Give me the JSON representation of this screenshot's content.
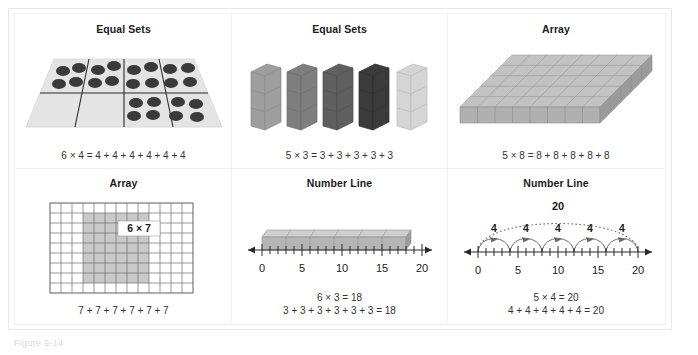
{
  "figure": {
    "caption": "Figure 9-14",
    "panels": [
      {
        "id": "equal-sets-dots",
        "title": "Equal Sets",
        "model": "equal-sets",
        "equation_line1": "6 × 4 = 4 + 4 + 4 + 4 + 4 + 4",
        "equation_line2": "",
        "groups": 6,
        "items_per_group": 4,
        "product": 24,
        "item_shape": "dot",
        "dot_color": "#3a3a3a",
        "mat_color": "#e2e2e2"
      },
      {
        "id": "equal-sets-cubes",
        "title": "Equal Sets",
        "model": "equal-sets",
        "equation_line1": "5 × 3 = 3 + 3 + 3 + 3 + 3",
        "equation_line2": "",
        "groups": 5,
        "items_per_group": 3,
        "product": 15,
        "item_shape": "cube",
        "tower_colors": [
          "#9e9e9e",
          "#7e7e7e",
          "#5f5f5f",
          "#3b3b3b",
          "#d5d5d5"
        ]
      },
      {
        "id": "array-cubes",
        "title": "Array",
        "model": "array",
        "equation_line1": "5 × 8 = 8 + 8 + 8 + 8 + 8",
        "equation_line2": "",
        "rows": 5,
        "cols": 8,
        "product": 40,
        "cube_color": "#bdbdbd"
      },
      {
        "id": "array-grid",
        "title": "Array",
        "model": "array",
        "equation_line1": "7 + 7 + 7 + 7 + 7 + 7",
        "equation_line2": "",
        "label": "6 × 7",
        "grid_cols": 13,
        "grid_rows": 9,
        "shaded_cols": 6,
        "shaded_rows": 7,
        "shade_color": "#c9c9c9",
        "line_color": "#6e6e6e"
      },
      {
        "id": "number-line-bar",
        "title": "Number Line",
        "model": "number-line",
        "equation_line1": "6 × 3 = 18",
        "equation_line2": "3 + 3 + 3 + 3 + 3 + 3 = 18",
        "axis_min": 0,
        "axis_max": 20,
        "major_ticks": [
          0,
          5,
          10,
          15,
          20
        ],
        "tick_labels": [
          "0",
          "5",
          "10",
          "15",
          "20"
        ],
        "jumps": 6,
        "jump_size": 3,
        "bar_end": 18,
        "bar_color": "#b5b5b5"
      },
      {
        "id": "number-line-arcs",
        "title": "Number Line",
        "model": "number-line",
        "equation_line1": "5 × 4 = 20",
        "equation_line2": "4 + 4 + 4 + 4 + 4 = 20",
        "axis_min": 0,
        "axis_max": 20,
        "major_ticks": [
          0,
          5,
          10,
          15,
          20
        ],
        "tick_labels": [
          "0",
          "5",
          "10",
          "15",
          "20"
        ],
        "jumps": 5,
        "jump_size": 4,
        "arc_labels": [
          "4",
          "4",
          "4",
          "4",
          "4"
        ],
        "total_label": "20",
        "arc_color": "#6b6b6b"
      }
    ]
  }
}
